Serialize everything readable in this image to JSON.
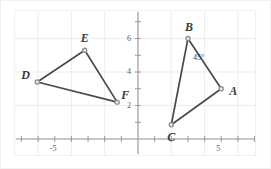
{
  "figure": {
    "background_color": "#ffffff",
    "border_color": "#f2f0f0",
    "grid_color": "#f0eceb",
    "axis_color": "#9a9a9a",
    "line_color": "#4a4a4a",
    "vertex_color": "#8a8a8a",
    "label_color": "#3a3a3a"
  },
  "chart_data": {
    "type": "scatter",
    "title": "",
    "xlabel": "",
    "ylabel": "",
    "xlim": [
      -8.3,
      8.0
    ],
    "ylim": [
      -0.85,
      8.8
    ],
    "grid": true,
    "grid_step": 2,
    "tick_step": 1,
    "legend": "none",
    "xticks": [
      -8,
      -7,
      -6,
      -5,
      -4,
      -3,
      -2,
      -1,
      0,
      1,
      2,
      3,
      4,
      5,
      6,
      7
    ],
    "yticks": [
      0,
      1,
      2,
      3,
      4,
      5,
      6,
      7,
      8
    ],
    "xtick_labels": [
      {
        "value": -5,
        "text": "-5"
      },
      {
        "value": 5,
        "text": "5"
      }
    ],
    "ytick_labels": [
      {
        "value": 2,
        "text": "2"
      },
      {
        "value": 4,
        "text": "4"
      },
      {
        "value": 6,
        "text": "6"
      }
    ],
    "series": [
      {
        "name": "Triangle ABC",
        "closed": true,
        "points": [
          {
            "label": "A",
            "x": 5.0,
            "y": 3.0,
            "label_dx": 8,
            "label_dy": -4
          },
          {
            "label": "B",
            "x": 3.0,
            "y": 6.0,
            "label_dx": -3,
            "label_dy": -18
          },
          {
            "label": "C",
            "x": 2.0,
            "y": 0.85,
            "label_dx": -4,
            "label_dy": 6
          }
        ]
      },
      {
        "name": "Triangle DEF",
        "closed": true,
        "points": [
          {
            "label": "D",
            "x": -6.05,
            "y": 3.4,
            "label_dx": -16,
            "label_dy": -13
          },
          {
            "label": "E",
            "x": -3.2,
            "y": 5.3,
            "label_dx": -4,
            "label_dy": -18
          },
          {
            "label": "F",
            "x": -1.25,
            "y": 2.2,
            "label_dx": 4,
            "label_dy": -13
          }
        ]
      }
    ],
    "annotations": [
      {
        "name": "angle-b-45",
        "text": "45°",
        "x": 3.25,
        "y": 4.85
      }
    ]
  }
}
